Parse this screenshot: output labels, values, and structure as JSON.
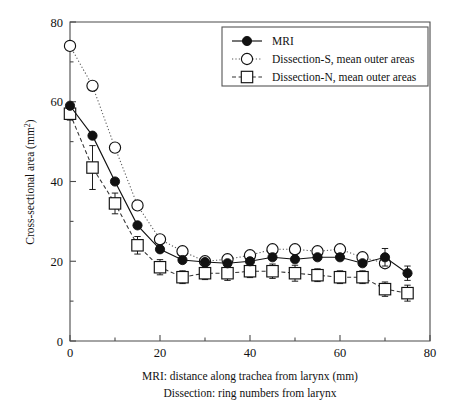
{
  "figure": {
    "background_color": "#ffffff",
    "ink_color": "#111111"
  },
  "chart_data": {
    "type": "line",
    "title": "",
    "subtitle": "",
    "xlabel": "MRI: distance along trachea from larynx (mm)",
    "xlabel_line2": "Dissection: ring numbers from larynx",
    "ylabel": "Cross-sectional area (mm²)",
    "ylabel_unit": "mm2",
    "xlim": [
      0,
      80
    ],
    "ylim": [
      0,
      80
    ],
    "xticks": [
      0,
      20,
      40,
      60,
      80
    ],
    "xticklabels": [
      "0",
      "20",
      "40",
      "60",
      "80"
    ],
    "xminorticks": [
      10,
      30,
      50,
      70
    ],
    "yticks": [
      0,
      20,
      40,
      60,
      80
    ],
    "yticklabels": [
      "0",
      "20",
      "40",
      "60",
      "80"
    ],
    "yminorticks": [
      10,
      30,
      50,
      70
    ],
    "grid": false,
    "legend_position": "top-right",
    "x": [
      0,
      5,
      10,
      15,
      20,
      25,
      30,
      35,
      40,
      45,
      50,
      55,
      60,
      65,
      70,
      75
    ],
    "series": [
      {
        "name": "MRI",
        "marker": "filled-circle",
        "linestyle": "solid",
        "color": "#111111",
        "values": [
          59.0,
          51.5,
          40.0,
          29.0,
          23.0,
          20.3,
          19.8,
          19.5,
          20.0,
          21.0,
          20.5,
          21.0,
          21.0,
          19.5,
          21.0,
          17.0
        ],
        "errors": [
          0,
          0,
          0,
          0,
          0,
          0,
          0,
          0,
          0,
          0,
          0,
          0,
          0,
          0,
          2.2,
          1.8
        ]
      },
      {
        "name": "Dissection-S, mean outer areas",
        "marker": "open-circle",
        "linestyle": "dotted",
        "color": "#111111",
        "values": [
          74.0,
          64.0,
          48.5,
          34.0,
          25.5,
          22.5,
          20.0,
          20.5,
          21.5,
          23.0,
          23.0,
          22.5,
          23.0,
          21.0,
          19.5,
          null
        ],
        "errors": [
          0,
          0,
          0,
          0,
          0,
          0,
          0,
          0,
          0,
          0,
          0,
          0,
          0,
          0,
          0,
          0
        ]
      },
      {
        "name": "Dissection-N, mean outer areas",
        "marker": "open-square",
        "linestyle": "dashed",
        "color": "#111111",
        "values": [
          57.0,
          43.5,
          34.5,
          24.0,
          18.5,
          16.0,
          17.0,
          17.0,
          17.5,
          17.5,
          17.0,
          16.5,
          16.0,
          16.0,
          13.0,
          12.0
        ],
        "errors": [
          1.6,
          5.5,
          2.6,
          2.2,
          1.9,
          1.6,
          1.6,
          1.8,
          1.6,
          1.8,
          2.0,
          1.6,
          1.6,
          1.6,
          1.8,
          2.0
        ]
      }
    ]
  },
  "legend": {
    "entries": [
      {
        "label": "MRI",
        "marker": "filled-circle",
        "linestyle": "solid"
      },
      {
        "label": "Dissection-S, mean outer areas",
        "marker": "open-circle",
        "linestyle": "dotted"
      },
      {
        "label": "Dissection-N, mean outer areas",
        "marker": "open-square",
        "linestyle": "dashed"
      }
    ]
  }
}
